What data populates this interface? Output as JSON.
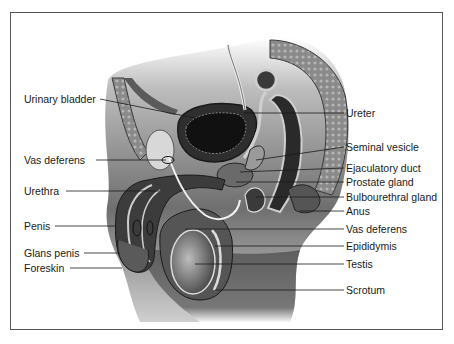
{
  "figure": {
    "labels_left": [
      {
        "text": "Urinary bladder",
        "x": 24,
        "y": 93
      },
      {
        "text": "Vas deferens",
        "x": 24,
        "y": 154
      },
      {
        "text": "Urethra",
        "x": 24,
        "y": 185
      },
      {
        "text": "Penis",
        "x": 24,
        "y": 220
      },
      {
        "text": "Glans penis",
        "x": 24,
        "y": 248
      },
      {
        "text": "Foreskin",
        "x": 24,
        "y": 262
      }
    ],
    "labels_right": [
      {
        "text": "Ureter",
        "x": 346,
        "y": 107
      },
      {
        "text": "Seminal vesicle",
        "x": 346,
        "y": 141
      },
      {
        "text": "Ejaculatory duct",
        "x": 346,
        "y": 162
      },
      {
        "text": "Prostate gland",
        "x": 346,
        "y": 176
      },
      {
        "text": "Bulbourethral gland",
        "x": 346,
        "y": 191
      },
      {
        "text": "Anus",
        "x": 346,
        "y": 205
      },
      {
        "text": "Vas deferens",
        "x": 346,
        "y": 223
      },
      {
        "text": "Epididymis",
        "x": 346,
        "y": 240
      },
      {
        "text": "Testis",
        "x": 346,
        "y": 258
      },
      {
        "text": "Scrotum",
        "x": 346,
        "y": 284
      }
    ]
  }
}
